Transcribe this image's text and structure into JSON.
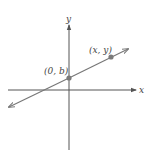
{
  "figure": {
    "axes": {
      "x_label": "x",
      "y_label": "y"
    },
    "points": [
      {
        "label": "(0, b)",
        "role": "y-intercept"
      },
      {
        "label": "(x, y)",
        "role": "general point"
      }
    ],
    "colors": {
      "axis": "#555555",
      "line": "#777777",
      "point": "#7a7a7a",
      "label": "#444444"
    }
  }
}
